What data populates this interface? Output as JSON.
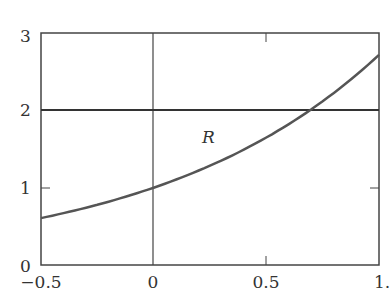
{
  "chart_data": {
    "type": "line",
    "title": "",
    "xlabel": "",
    "ylabel": "",
    "xlim": [
      -0.5,
      1.0
    ],
    "ylim": [
      0,
      3
    ],
    "grid": false,
    "x_ticks": [
      -0.5,
      0,
      0.5,
      1.0
    ],
    "x_tick_labels": [
      "−0.5",
      "0",
      "0.5",
      "1."
    ],
    "y_ticks": [
      0,
      1,
      2,
      3
    ],
    "y_tick_labels": [
      "0",
      "1",
      "2",
      "3"
    ],
    "series": [
      {
        "name": "y = e^x",
        "x": [
          -0.5,
          -0.25,
          0,
          0.25,
          0.5,
          0.6931,
          0.75,
          1.0
        ],
        "values": [
          0.607,
          0.779,
          1.0,
          1.284,
          1.649,
          2.0,
          2.117,
          2.718
        ],
        "color": "#555555"
      },
      {
        "name": "y = 2",
        "x": [
          -0.5,
          1.0
        ],
        "values": [
          2,
          2
        ],
        "color": "#333333"
      }
    ],
    "reference_lines": [
      {
        "orientation": "vertical",
        "x": 0
      }
    ],
    "annotations": [
      {
        "text": "R",
        "x": 0.35,
        "y": 1.6
      }
    ]
  }
}
